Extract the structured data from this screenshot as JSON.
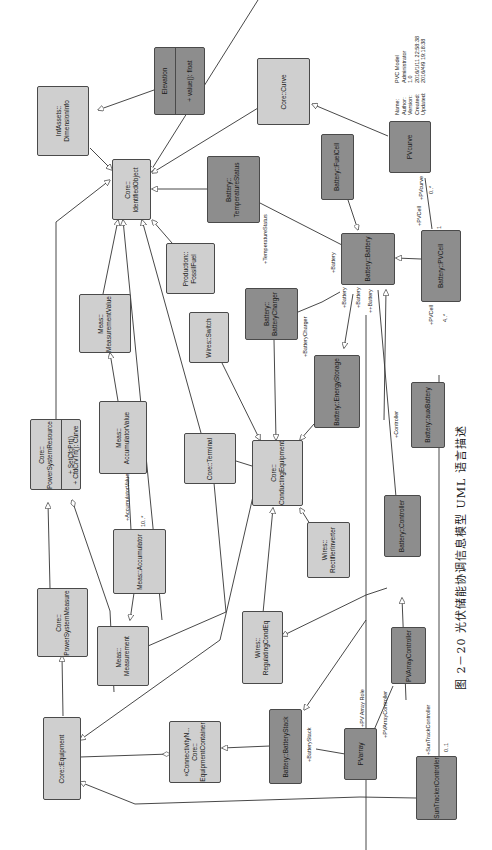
{
  "diagram": {
    "type": "UML class diagram",
    "orientation": "rotated 90° counter-clockwise",
    "colors": {
      "light_class": "#cfcfcf",
      "dark_class": "#8d8d8d",
      "border": "#4a4a4a",
      "line": "#333333",
      "background": "#ffffff"
    }
  },
  "metadata": {
    "name_key": "Name:",
    "name": "PVC Model",
    "author_key": "Author:",
    "author": "Administrator",
    "version_key": "Version:",
    "version": "1.0",
    "created_key": "Created:",
    "created": "2016/1/11 22:58:38",
    "updated_key": "Updated:",
    "updated": "2016/4/9 19:18:38"
  },
  "classes": {
    "infassets_dimensioninfo": {
      "label": "InfAssets::\nDimensionInfo",
      "style": "light"
    },
    "elevation": {
      "label": "Elevation",
      "attribute": "+  value(): float",
      "style": "dark"
    },
    "core_curve": {
      "label": "Core::Curve",
      "style": "light"
    },
    "pvcurve": {
      "label": "PVcurve",
      "style": "dark"
    },
    "core_identifiedobject": {
      "label": "Core::\nIdentifiedObject",
      "style": "light"
    },
    "battery_temperaturestatus": {
      "label": "Battery::\nTemperatureStatus",
      "style": "dark"
    },
    "battery_fuelcell": {
      "label": "Battery::FuelCell",
      "style": "dark"
    },
    "production_fossilfuel": {
      "label": "Production::\nFossilFuel",
      "style": "light"
    },
    "battery_battery": {
      "label": "Battery::Battery",
      "style": "dark"
    },
    "battery_pvcell": {
      "label": "Battery::PVCell",
      "style": "dark"
    },
    "meas_measurementvalue": {
      "label": "Meas::\nMeasurementValue",
      "style": "light"
    },
    "wires_switch": {
      "label": "Wires::Switch",
      "style": "light"
    },
    "battery_batterycharger": {
      "label": "Battery::\nBatteryCharger",
      "style": "dark"
    },
    "battery_energystorage": {
      "label": "Battery::EnergyStorage",
      "style": "dark"
    },
    "battery_auxbattery": {
      "label": "Battery::auxBattery",
      "style": "dark"
    },
    "core_powersystemresource": {
      "label": "Core::\nPowerSystemResource",
      "ops": [
        "+  SetCfcPrt()",
        "+  CfdCrvTrt(): Curve"
      ],
      "style": "light"
    },
    "meas_accumulatorvalue": {
      "label": "Meas::\nAccumulatorValue",
      "style": "light"
    },
    "core_terminal": {
      "label": "Core::Terminal",
      "style": "light"
    },
    "core_conductingequipment": {
      "label": "Core::\nConductingEquipment",
      "style": "light"
    },
    "meas_accumulator": {
      "label": "Meas::Accumulator",
      "style": "light"
    },
    "wires_rectifierinverter": {
      "label": "Wires::\nRectifierInverter",
      "style": "light"
    },
    "battery_controller": {
      "label": "Battery::Controller",
      "style": "dark"
    },
    "core_powersystemmeasure": {
      "label": "Core::\nPowerSystemMeasure",
      "style": "light"
    },
    "meas_measurement": {
      "label": "Meas::  \nMeasurement",
      "style": "light"
    },
    "wires_regulatingcondeq": {
      "label": "Wires::\nRegulatingCondEq",
      "style": "light"
    },
    "pvarraycontroller": {
      "label": "PVArrayController",
      "style": "dark"
    },
    "core_equipment": {
      "label": "Core::Equipment",
      "style": "light"
    },
    "core_equipmentcontainer": {
      "label": "«ConnectivityN...\nCore::\nEquipmentContainer",
      "style": "light"
    },
    "battery_batterystack": {
      "label": "Battery::BatteryStack",
      "style": "dark"
    },
    "pvarray": {
      "label": "PVarray",
      "style": "dark"
    },
    "suntrackercontroller": {
      "label": "SunTrackerController",
      "style": "dark"
    }
  },
  "roles": {
    "pvcurve": "+PVcurve",
    "pvcurve_mult": "0..*",
    "pvcell_top": "+PVCell",
    "pvcell_top_mult": "1",
    "pvcell_bottom": "+PVCell",
    "pvcell_bottom_mult": "4..*",
    "temperaturestatus": "+TemperatureStatus",
    "battery_1": "+Battery",
    "battery_2": "+Battery",
    "battery_3": "+Battery",
    "battery_4": "++Battery",
    "batterycharger": "+BatteryCharger",
    "controller": "+Controller",
    "accumulatorvalue": "+AccumulatorValue",
    "accumulatorvalue_mult": "10..*",
    "batterystack": "+BatteryStack",
    "pv_array_role": "+PV Array Role",
    "pvarraycontroller": "+PVArrayController",
    "suntrackcontroller": "+SunTrackController",
    "suntrack_mult": "0..1"
  },
  "caption": "图 2－20   光伏储能协调信息模型 UML 语言描述"
}
